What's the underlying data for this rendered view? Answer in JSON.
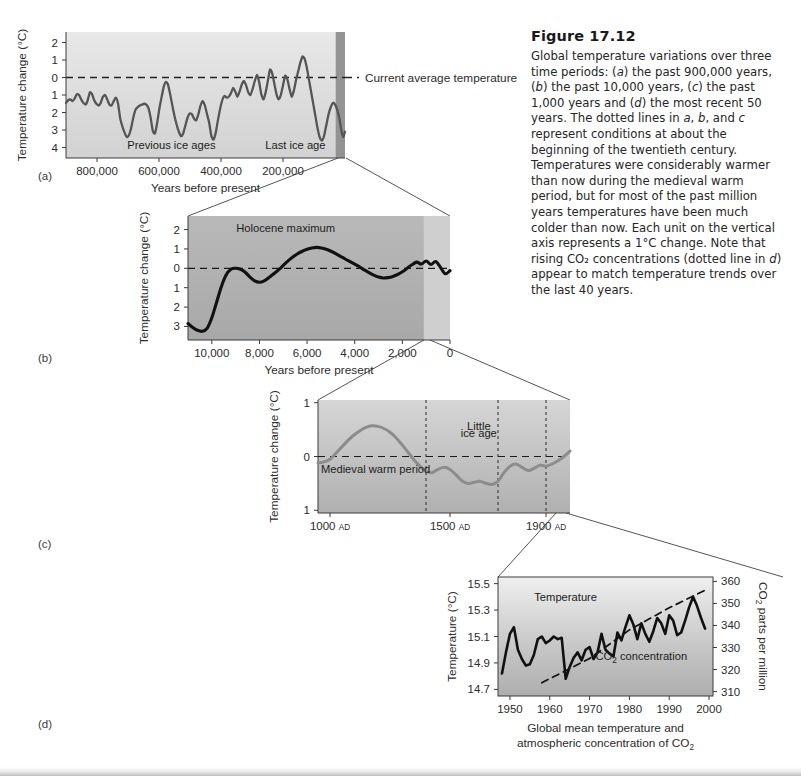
{
  "figure": {
    "number": "Figure 17.12",
    "caption_runs": [
      {
        "t": "Global temperature variations over three time periods: ("
      },
      {
        "t": "a",
        "i": true
      },
      {
        "t": ") the past 900,000 years, ("
      },
      {
        "t": "b",
        "i": true
      },
      {
        "t": ") the past 10,000 years, ("
      },
      {
        "t": "c",
        "i": true
      },
      {
        "t": ") the past 1,000 years and ("
      },
      {
        "t": "d",
        "i": true
      },
      {
        "t": ") the most recent 50 years. The dotted lines in "
      },
      {
        "t": "a",
        "i": true
      },
      {
        "t": ", "
      },
      {
        "t": "b",
        "i": true
      },
      {
        "t": ", and "
      },
      {
        "t": "c",
        "i": true
      },
      {
        "t": " represent conditions at about the beginning of the twentieth century. Temperatures were considerably warmer than now during the medieval warm period, but for most of the past million years temperatures have been much colder than now. Each unit on the vertical axis represents a 1°C change. Note that rising CO₂ concentrations (dotted line in "
      },
      {
        "t": "d",
        "i": true
      },
      {
        "t": ") appear to match temperature trends over the last 40 years."
      }
    ],
    "panel_labels": [
      "(a)",
      "(b)",
      "(c)",
      "(d)"
    ]
  },
  "colors": {
    "curve_a": "#555555",
    "curve_b": "#111111",
    "curve_c": "#8c8c8c",
    "curve_d": "#111111",
    "dashed_baseline": "#222222",
    "plot_bg_light": "#e3e3e3",
    "plot_bg_mid": "#b8b8b8",
    "plot_bg_dark": "#9a9a9a",
    "highlight_band": "#8f8f8f",
    "axis": "#3a3a3a",
    "connector": "#555555"
  },
  "chart_data": [
    {
      "id": "panel-a",
      "type": "line",
      "title": "",
      "xlabel": "Years before present",
      "ylabel": "Temperature change (°C)",
      "xticks": [
        800000,
        600000,
        400000,
        200000
      ],
      "xtick_labels": [
        "800,000",
        "600,000",
        "400,000",
        "200,000"
      ],
      "xlim": [
        900000,
        0
      ],
      "yticks": [
        2,
        1,
        0,
        -1,
        -2,
        -3,
        -4
      ],
      "ytick_labels": [
        "2",
        "1",
        "0",
        "1",
        "2",
        "3",
        "4"
      ],
      "ylim": [
        -4.6,
        2.6
      ],
      "baseline": 0,
      "baseline_label": "Current average temperature",
      "annotations": [
        {
          "text": "Previous ice ages",
          "x": 560000,
          "y": -4.1
        },
        {
          "text": "Last ice age",
          "x": 160000,
          "y": -4.1
        }
      ],
      "highlight_band": {
        "from": 30000,
        "to": 0
      },
      "x": [
        900000,
        893000,
        886000,
        879000,
        872000,
        865000,
        858000,
        851000,
        844000,
        837000,
        830000,
        823000,
        816000,
        809000,
        802000,
        795000,
        788000,
        781000,
        774000,
        767000,
        760000,
        753000,
        746000,
        739000,
        732000,
        725000,
        718000,
        711000,
        704000,
        697000,
        690000,
        683000,
        676000,
        669000,
        662000,
        655000,
        648000,
        641000,
        634000,
        627000,
        620000,
        613000,
        606000,
        599000,
        592000,
        585000,
        578000,
        571000,
        564000,
        557000,
        550000,
        543000,
        536000,
        529000,
        522000,
        515000,
        508000,
        501000,
        494000,
        487000,
        480000,
        473000,
        466000,
        459000,
        452000,
        445000,
        438000,
        431000,
        424000,
        417000,
        410000,
        403000,
        396000,
        389000,
        382000,
        375000,
        368000,
        361000,
        354000,
        347000,
        340000,
        333000,
        326000,
        319000,
        312000,
        305000,
        298000,
        291000,
        284000,
        277000,
        270000,
        263000,
        256000,
        249000,
        242000,
        235000,
        228000,
        221000,
        214000,
        207000,
        200000,
        193000,
        186000,
        179000,
        172000,
        165000,
        158000,
        151000,
        144000,
        137000,
        130000,
        123000,
        116000,
        109000,
        102000,
        95000,
        88000,
        81000,
        74000,
        67000,
        60000,
        53000,
        46000,
        39000,
        32000,
        25000,
        18000,
        12000,
        6000,
        0
      ],
      "y": [
        -1.45,
        -1.3,
        -1.25,
        -1.35,
        -1.2,
        -0.95,
        -1.0,
        -1.25,
        -1.45,
        -1.55,
        -1.3,
        -0.85,
        -0.95,
        -1.3,
        -1.5,
        -1.6,
        -1.45,
        -1.1,
        -1.0,
        -1.25,
        -1.55,
        -1.6,
        -1.35,
        -1.15,
        -1.5,
        -2.35,
        -2.8,
        -3.15,
        -3.4,
        -3.3,
        -2.9,
        -2.3,
        -1.85,
        -1.7,
        -1.6,
        -1.55,
        -1.5,
        -1.55,
        -1.75,
        -2.3,
        -3.05,
        -3.2,
        -2.6,
        -1.8,
        -1.15,
        -0.55,
        -0.25,
        -0.4,
        -0.95,
        -1.6,
        -2.2,
        -2.7,
        -3.1,
        -3.35,
        -3.2,
        -2.75,
        -2.3,
        -2.05,
        -2.1,
        -2.35,
        -2.45,
        -2.1,
        -1.6,
        -1.35,
        -1.6,
        -2.1,
        -2.6,
        -3.35,
        -3.55,
        -3.15,
        -2.45,
        -1.8,
        -1.3,
        -1.05,
        -1.15,
        -1.1,
        -0.9,
        -0.6,
        -0.8,
        -1.1,
        -0.8,
        -0.4,
        -0.2,
        -0.45,
        -0.85,
        -1.0,
        -0.65,
        -0.2,
        0.15,
        -0.25,
        -0.95,
        -1.25,
        -0.85,
        -0.2,
        0.45,
        0.25,
        -0.35,
        -0.95,
        -1.25,
        -1.0,
        -0.45,
        0.1,
        -0.1,
        -0.65,
        -1.1,
        -0.75,
        -0.15,
        0.35,
        0.85,
        1.2,
        1.05,
        0.55,
        -0.15,
        -0.85,
        -1.55,
        -2.25,
        -2.95,
        -3.45,
        -3.6,
        -3.3,
        -2.7,
        -2.1,
        -1.7,
        -1.45,
        -1.55,
        -1.85,
        -2.35,
        -3.0,
        -3.4,
        -3.1,
        -2.45,
        -1.8
      ],
      "note": "Curve is a sawtooth glacial–interglacial record; values are °C change relative to current average."
    },
    {
      "id": "panel-b",
      "type": "line",
      "title": "",
      "xlabel": "Years before present",
      "ylabel": "Temperature change (°C)",
      "xticks": [
        10000,
        8000,
        6000,
        4000,
        2000,
        0
      ],
      "xtick_labels": [
        "10,000",
        "8,000",
        "6,000",
        "4,000",
        "2,000",
        "0"
      ],
      "xlim": [
        11000,
        0
      ],
      "yticks": [
        2,
        1,
        0,
        -1,
        -2,
        -3
      ],
      "ytick_labels": [
        "2",
        "1",
        "0",
        "1",
        "2",
        "3"
      ],
      "ylim": [
        -3.7,
        2.7
      ],
      "baseline": 0,
      "annotations": [
        {
          "text": "Holocene maximum",
          "x": 6900,
          "y": 1.85
        }
      ],
      "highlight_band": {
        "from": 1100,
        "to": 0
      },
      "x": [
        11000,
        10800,
        10600,
        10400,
        10200,
        10000,
        9800,
        9600,
        9400,
        9200,
        9000,
        8800,
        8600,
        8400,
        8200,
        8000,
        7800,
        7600,
        7400,
        7200,
        7000,
        6800,
        6600,
        6400,
        6200,
        6000,
        5800,
        5600,
        5400,
        5200,
        5000,
        4800,
        4600,
        4400,
        4200,
        4000,
        3800,
        3600,
        3400,
        3200,
        3000,
        2800,
        2600,
        2400,
        2200,
        2000,
        1800,
        1600,
        1400,
        1200,
        1000,
        800,
        600,
        400,
        200,
        0
      ],
      "y": [
        -2.85,
        -3.05,
        -3.2,
        -3.25,
        -3.1,
        -2.55,
        -1.75,
        -0.95,
        -0.35,
        -0.05,
        0.0,
        -0.05,
        -0.2,
        -0.45,
        -0.65,
        -0.72,
        -0.65,
        -0.48,
        -0.28,
        -0.08,
        0.15,
        0.38,
        0.58,
        0.75,
        0.88,
        0.98,
        1.05,
        1.08,
        1.05,
        0.98,
        0.88,
        0.76,
        0.62,
        0.48,
        0.35,
        0.22,
        0.08,
        -0.08,
        -0.22,
        -0.35,
        -0.45,
        -0.5,
        -0.48,
        -0.42,
        -0.32,
        -0.18,
        0.0,
        0.18,
        0.32,
        0.22,
        0.38,
        0.2,
        0.35,
        0.05,
        -0.28,
        -0.12
      ]
    },
    {
      "id": "panel-c",
      "type": "line",
      "title": "",
      "xlabel": "",
      "ylabel": "Temperature change (°C)",
      "xticks": [
        1000,
        1500,
        1900
      ],
      "xtick_labels": [
        "1000 AD",
        "1500 AD",
        "1900 AD"
      ],
      "xlim": [
        950,
        2000
      ],
      "yticks": [
        1,
        0,
        -1
      ],
      "ytick_labels": [
        "1",
        "0",
        "1"
      ],
      "ylim": [
        -1.05,
        1.05
      ],
      "baseline": 0,
      "annotations": [
        {
          "text": "Medieval warm period",
          "x": 1190,
          "y": -0.3
        },
        {
          "text": "Little",
          "x": 1620,
          "y": 0.5
        },
        {
          "text": "ice age",
          "x": 1620,
          "y": 0.36
        }
      ],
      "vlines": [
        1400,
        1700,
        1900
      ],
      "x": [
        950,
        975,
        1000,
        1025,
        1050,
        1075,
        1100,
        1125,
        1150,
        1175,
        1200,
        1225,
        1250,
        1275,
        1300,
        1325,
        1350,
        1375,
        1400,
        1425,
        1450,
        1475,
        1500,
        1525,
        1550,
        1575,
        1600,
        1625,
        1650,
        1675,
        1700,
        1725,
        1750,
        1775,
        1800,
        1825,
        1850,
        1875,
        1900,
        1925,
        1950,
        1975,
        2000
      ],
      "y": [
        -0.12,
        -0.1,
        -0.05,
        0.06,
        0.18,
        0.3,
        0.4,
        0.48,
        0.54,
        0.57,
        0.56,
        0.52,
        0.45,
        0.35,
        0.22,
        0.08,
        -0.06,
        -0.18,
        -0.27,
        -0.3,
        -0.24,
        -0.2,
        -0.24,
        -0.34,
        -0.45,
        -0.5,
        -0.48,
        -0.46,
        -0.5,
        -0.52,
        -0.46,
        -0.3,
        -0.18,
        -0.14,
        -0.2,
        -0.26,
        -0.22,
        -0.16,
        -0.18,
        -0.14,
        -0.08,
        0.0,
        0.1
      ]
    },
    {
      "id": "panel-d",
      "type": "line",
      "title": "",
      "xlabel_lines": [
        "Global mean temperature and",
        "atmospheric concentration of CO₂"
      ],
      "ylabel": "Temperature (°C)",
      "ylabel_right": "CO₂ parts per million",
      "xticks": [
        1950,
        1960,
        1970,
        1980,
        1990,
        2000
      ],
      "xtick_labels": [
        "1950",
        "1960",
        "1970",
        "1980",
        "1990",
        "2000"
      ],
      "xlim": [
        1947,
        2001
      ],
      "yticks": [
        15.5,
        15.3,
        15.1,
        14.9,
        14.7
      ],
      "ytick_labels": [
        "15.5",
        "15.3",
        "15.1",
        "14.9",
        "14.7"
      ],
      "ylim": [
        14.65,
        15.55
      ],
      "yticks_right": [
        360,
        350,
        340,
        330,
        320,
        310
      ],
      "ytick_labels_right": [
        "360",
        "350",
        "340",
        "330",
        "320",
        "310"
      ],
      "ylim_right": [
        308,
        362
      ],
      "annotations": [
        {
          "text": "Temperature",
          "x": 1964,
          "y": 15.37
        },
        {
          "text": "CO₂ concentration",
          "x": 1983,
          "y": 14.92
        }
      ],
      "series": [
        {
          "name": "Temperature",
          "unit": "°C",
          "axis": "left",
          "style": "solid",
          "x": [
            1948,
            1949,
            1950,
            1951,
            1952,
            1953,
            1954,
            1955,
            1956,
            1957,
            1958,
            1959,
            1960,
            1961,
            1962,
            1963,
            1964,
            1965,
            1966,
            1967,
            1968,
            1969,
            1970,
            1971,
            1972,
            1973,
            1974,
            1975,
            1976,
            1977,
            1978,
            1979,
            1980,
            1981,
            1982,
            1983,
            1984,
            1985,
            1986,
            1987,
            1988,
            1989,
            1990,
            1991,
            1992,
            1993,
            1994,
            1995,
            1996,
            1997,
            1998,
            1999
          ],
          "y": [
            14.82,
            14.98,
            15.12,
            15.17,
            15.0,
            14.93,
            14.88,
            14.89,
            14.96,
            15.08,
            15.1,
            15.05,
            15.07,
            15.1,
            15.08,
            15.09,
            14.78,
            14.87,
            14.94,
            14.98,
            14.92,
            15.0,
            15.02,
            14.93,
            14.98,
            15.12,
            15.0,
            14.97,
            14.95,
            15.13,
            15.07,
            15.17,
            15.26,
            15.19,
            15.08,
            15.2,
            15.12,
            15.06,
            15.14,
            15.24,
            15.2,
            15.12,
            15.26,
            15.22,
            15.11,
            15.13,
            15.22,
            15.32,
            15.4,
            15.33,
            15.24,
            15.16
          ]
        },
        {
          "name": "CO₂ concentration",
          "unit": "ppm",
          "axis": "right",
          "style": "dashed",
          "x": [
            1958,
            1970,
            1980,
            1990,
            1999
          ],
          "y": [
            314,
            325,
            338,
            348,
            356
          ]
        }
      ]
    }
  ]
}
